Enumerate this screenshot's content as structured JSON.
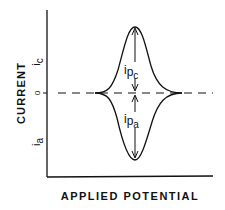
{
  "figure": {
    "y_axis_label": "CURRENT",
    "x_axis_label": "APPLIED POTENTIAL",
    "tick_cathodic_main": "i",
    "tick_cathodic_sub": "c",
    "tick_zero": "0",
    "tick_anodic_main": "i",
    "tick_anodic_sub": "a",
    "peak_cathodic_main": "i",
    "peak_cathodic_p": "p",
    "peak_cathodic_sub": "c",
    "peak_anodic_main": "i",
    "peak_anodic_p": "p",
    "peak_anodic_sub": "a",
    "line_color": "#111111",
    "background": "#ffffff"
  }
}
